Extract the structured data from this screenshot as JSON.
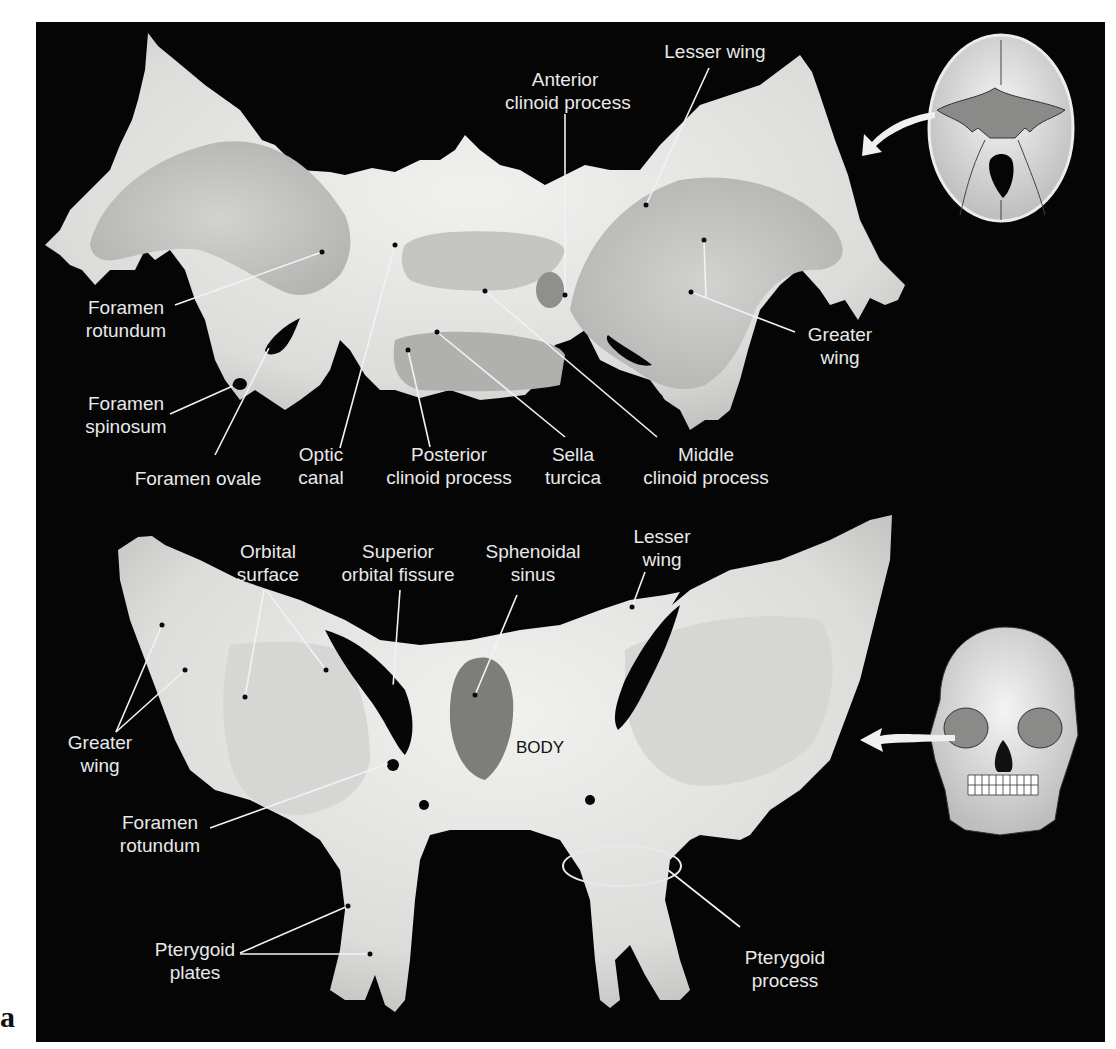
{
  "figure": {
    "panel_letter": "a",
    "colors": {
      "background": "#050505",
      "bone_light": "#e8e8e6",
      "bone_mid": "#c9c9c7",
      "bone_shade": "#a9a9a7",
      "sinus": "#7d7d7b",
      "label_text": "#e9e9e9",
      "leader_line": "#f2f2f2"
    }
  },
  "superior_view": {
    "labels": {
      "anterior_clinoid": "Anterior\nclinoid process",
      "lesser_wing": "Lesser wing",
      "foramen_rotundum": "Foramen\nrotundum",
      "greater_wing": "Greater\nwing",
      "foramen_spinosum": "Foramen\nspinosum",
      "foramen_ovale": "Foramen ovale",
      "optic_canal": "Optic\ncanal",
      "posterior_clinoid": "Posterior\nclinoid process",
      "sella_turcica": "Sella\nturcica",
      "middle_clinoid": "Middle\nclinoid process"
    },
    "inset": "skull-base-superior-view"
  },
  "anterior_view": {
    "labels": {
      "orbital_surface": "Orbital\nsurface",
      "superior_orbital_fissure": "Superior\norbital fissure",
      "sphenoidal_sinus": "Sphenoidal\nsinus",
      "lesser_wing": "Lesser\nwing",
      "greater_wing": "Greater\nwing",
      "body": "BODY",
      "foramen_rotundum": "Foramen\nrotundum",
      "pterygoid_plates": "Pterygoid\nplates",
      "pterygoid_process": "Pterygoid\nprocess"
    },
    "inset": "skull-anterior-view"
  }
}
